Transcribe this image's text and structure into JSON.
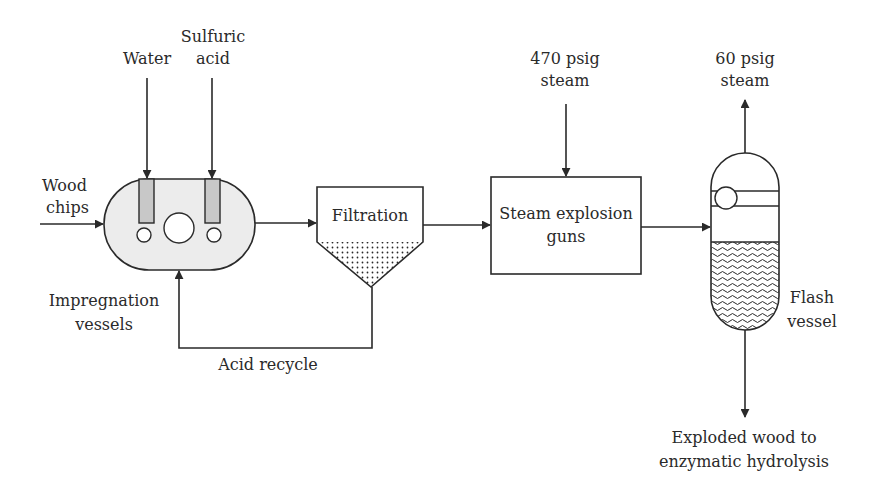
{
  "diagram": {
    "inputs": {
      "water": "Water",
      "sulfuric_acid_line1": "Sulfuric",
      "sulfuric_acid_line2": "acid",
      "wood_chips_line1": "Wood",
      "wood_chips_line2": "chips",
      "steam_470_line1": "470 psig",
      "steam_470_line2": "steam"
    },
    "outputs": {
      "steam_60_line1": "60 psig",
      "steam_60_line2": "steam",
      "product_line1": "Exploded wood to",
      "product_line2": "enzymatic hydrolysis"
    },
    "units": {
      "impregnation_line1": "Impregnation",
      "impregnation_line2": "vessels",
      "filtration": "Filtration",
      "steam_guns_line1": "Steam explosion",
      "steam_guns_line2": "guns",
      "flash_line1": "Flash",
      "flash_line2": "vessel"
    },
    "streams": {
      "recycle": "Acid recycle"
    },
    "colors": {
      "line": "#2a2a2a",
      "vessel_fill": "#ececec",
      "tube_fill": "#c8c8c8",
      "background": "#ffffff"
    }
  }
}
